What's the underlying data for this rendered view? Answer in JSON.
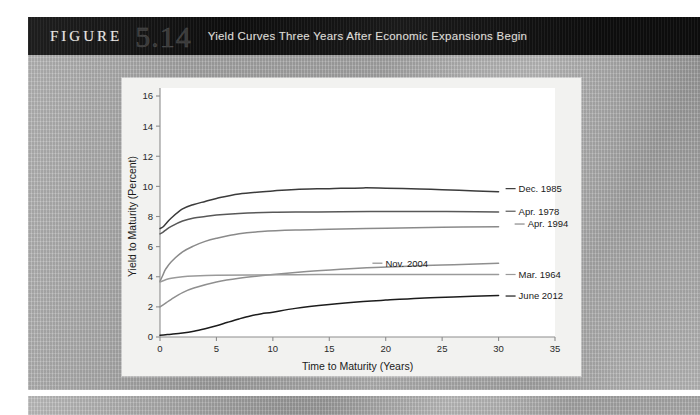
{
  "figure": {
    "label": "FIGURE",
    "number": "5.14",
    "caption": "Yield Curves Three Years After Economic Expansions Begin"
  },
  "chart_data": {
    "type": "line",
    "title": "Yield Curves Three Years After Economic Expansions Begin",
    "xlabel": "Time to Maturity (Years)",
    "ylabel": "Yield to Maturity (Percent)",
    "xlim": [
      0,
      35
    ],
    "ylim": [
      0,
      16
    ],
    "xticks": [
      0,
      5,
      10,
      15,
      20,
      25,
      30,
      35
    ],
    "yticks": [
      0,
      2,
      4,
      6,
      8,
      10,
      12,
      14,
      16
    ],
    "grid": false,
    "legend_position": "right-inline-labels",
    "series": [
      {
        "name": "Dec. 1985",
        "color": "#3b3b3b",
        "label_x": 30.8,
        "label_y": 9.85,
        "x": [
          0,
          0.25,
          0.5,
          1,
          2,
          3,
          4,
          5,
          7,
          10,
          12,
          15,
          18,
          20,
          23,
          25,
          28,
          30
        ],
        "y": [
          7.2,
          7.3,
          7.5,
          7.9,
          8.5,
          8.8,
          9.0,
          9.2,
          9.5,
          9.7,
          9.8,
          9.85,
          9.9,
          9.88,
          9.83,
          9.78,
          9.7,
          9.65
        ]
      },
      {
        "name": "Apr. 1978",
        "color": "#585858",
        "label_x": 30.8,
        "label_y": 8.35,
        "x": [
          0,
          0.25,
          0.5,
          1,
          2,
          3,
          4,
          5,
          7,
          10,
          13,
          16,
          20,
          24,
          28,
          30
        ],
        "y": [
          6.85,
          6.95,
          7.1,
          7.35,
          7.7,
          7.9,
          8.0,
          8.1,
          8.2,
          8.28,
          8.3,
          8.32,
          8.33,
          8.33,
          8.32,
          8.3
        ]
      },
      {
        "name": "Apr. 1994",
        "color": "#8a8a8a",
        "label_x": 31.6,
        "label_y": 7.5,
        "x": [
          0,
          0.25,
          0.5,
          1,
          2,
          3,
          4,
          5,
          7,
          9,
          12,
          15,
          20,
          25,
          30
        ],
        "y": [
          3.7,
          4.1,
          4.5,
          5.0,
          5.65,
          6.05,
          6.35,
          6.55,
          6.85,
          7.0,
          7.1,
          7.15,
          7.22,
          7.28,
          7.32
        ]
      },
      {
        "name": "Nov. 2004",
        "color": "#8f8f8f",
        "label_x": 19.0,
        "label_y": 4.9,
        "x": [
          0,
          0.5,
          1,
          2,
          3,
          5,
          7,
          10,
          13,
          16,
          19,
          22,
          25,
          28,
          30
        ],
        "y": [
          2.0,
          2.25,
          2.5,
          2.95,
          3.25,
          3.65,
          3.9,
          4.15,
          4.35,
          4.5,
          4.62,
          4.7,
          4.78,
          4.85,
          4.9
        ]
      },
      {
        "name": "Mar. 1964",
        "color": "#9a9a9a",
        "label_x": 30.8,
        "label_y": 4.15,
        "x": [
          0,
          0.5,
          1,
          2,
          3,
          5,
          8,
          12,
          16,
          20,
          25,
          30
        ],
        "y": [
          3.65,
          3.8,
          3.9,
          4.0,
          4.05,
          4.1,
          4.12,
          4.14,
          4.15,
          4.15,
          4.15,
          4.15
        ]
      },
      {
        "name": "June 2012",
        "color": "#1c1c1c",
        "label_x": 30.8,
        "label_y": 2.72,
        "x": [
          0,
          0.5,
          1,
          2,
          3,
          4,
          5,
          6,
          7,
          8,
          9,
          10,
          12,
          15,
          18,
          20,
          23,
          26,
          30
        ],
        "y": [
          0.12,
          0.15,
          0.18,
          0.26,
          0.38,
          0.55,
          0.75,
          0.98,
          1.2,
          1.4,
          1.55,
          1.65,
          1.9,
          2.15,
          2.35,
          2.45,
          2.58,
          2.66,
          2.75
        ]
      }
    ]
  }
}
